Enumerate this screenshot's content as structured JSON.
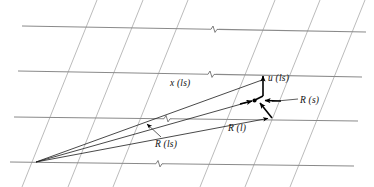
{
  "figure": {
    "background_color": "#ffffff",
    "width": 374,
    "height": 187,
    "colors": {
      "gridline_horizontal": "#8a8a8a",
      "gridline_slanted": "#b3b3b3",
      "ray": "#1a1a1a",
      "vector": "#000000",
      "label_text": "#111111"
    }
  },
  "labels": {
    "x_ls": "x (ls)",
    "u_ls": "u (ls)",
    "R_s": "R (s)",
    "R_l": "R (l)",
    "R_ls": "R (ls)"
  },
  "geometry": {
    "origin_vertex": {
      "x": 36,
      "y": 162
    },
    "horizontal_gridlines": [
      {
        "name": "grid-row-1",
        "x1": 22,
        "y1": 26,
        "x2": 366,
        "y2": 32
      },
      {
        "name": "grid-row-2",
        "x1": 18,
        "y1": 71,
        "x2": 362,
        "y2": 77
      },
      {
        "name": "grid-row-3",
        "x1": 14,
        "y1": 117,
        "x2": 358,
        "y2": 121
      },
      {
        "name": "grid-row-4",
        "x1": 10,
        "y1": 162,
        "x2": 354,
        "y2": 166
      }
    ],
    "slanted_gridlines": [
      {
        "name": "grid-col-1",
        "x_top": 97,
        "x_bottom": 22
      },
      {
        "name": "grid-col-2",
        "x_top": 143,
        "x_bottom": 68
      },
      {
        "name": "grid-col-3",
        "x_top": 188,
        "x_bottom": 113
      },
      {
        "name": "grid-col-4",
        "x_top": 275,
        "x_bottom": 200
      },
      {
        "name": "grid-col-5",
        "x_top": 320,
        "x_bottom": 245
      },
      {
        "name": "grid-col-6",
        "x_top": 365,
        "x_bottom": 290
      }
    ],
    "break_marks": [
      {
        "name": "break-row-1",
        "x": 215,
        "y": 29
      },
      {
        "name": "break-row-2",
        "x": 212,
        "y": 74
      },
      {
        "name": "break-row-3",
        "x": 168,
        "y": 119
      },
      {
        "name": "break-row-4",
        "x": 160,
        "y": 163
      }
    ],
    "rays": [
      {
        "name": "ray-x-ls",
        "x1": 36,
        "y1": 162,
        "x2": 262,
        "y2": 80
      },
      {
        "name": "ray-R-ls",
        "x1": 36,
        "y1": 162,
        "x2": 254,
        "y2": 100
      },
      {
        "name": "ray-R-l",
        "x1": 36,
        "y1": 162,
        "x2": 272,
        "y2": 119
      }
    ],
    "vectors": [
      {
        "name": "vector-u-ls",
        "x1": 263,
        "y1": 95,
        "x2": 263,
        "y2": 73
      },
      {
        "name": "vector-R-s",
        "x1": 272,
        "y1": 119,
        "x2": 258,
        "y2": 101
      },
      {
        "name": "vector-R-s-stub",
        "x1": 283,
        "y1": 101,
        "x2": 262,
        "y2": 100
      }
    ],
    "node_dots": [
      {
        "name": "node-mid",
        "x": 254,
        "y": 100
      }
    ],
    "leader_lines": [
      {
        "name": "leader-R-s",
        "x1": 297,
        "y1": 99,
        "x2": 268,
        "y2": 101
      },
      {
        "name": "leader-R-ls",
        "x1": 160,
        "y1": 136,
        "x2": 145,
        "y2": 122
      }
    ]
  }
}
